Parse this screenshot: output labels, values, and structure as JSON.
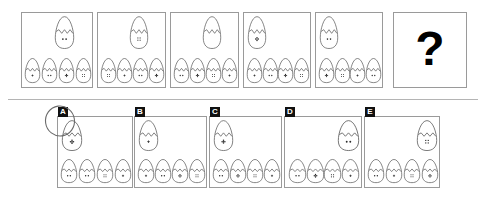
{
  "puzzle": {
    "title": "Egg Sequence Reasoning Puzzle",
    "unknown_marker": "?",
    "selected_option": "A",
    "question_panel_count": 6,
    "option_panel_count": 5
  },
  "colors": {
    "panel_border": "#9a9a9a",
    "egg_outline": "#555555",
    "divider": "#b4b4b4",
    "badge_bg": "#111111",
    "badge_text": "#ffffff",
    "qmark": "#000000",
    "background": "#ffffff",
    "selection_ink": "#6b6b6b"
  },
  "question_row": {
    "panels": [
      {
        "name": "question-panel-1",
        "top_egg": {
          "align": "center",
          "face": "two-dots"
        },
        "bottom_eggs": [
          {
            "face": "small-cross"
          },
          {
            "face": "two-dots"
          },
          {
            "face": "flower"
          },
          {
            "face": "four-squares"
          }
        ]
      },
      {
        "name": "question-panel-2",
        "top_egg": {
          "align": "center",
          "face": "four-squares"
        },
        "bottom_eggs": [
          {
            "face": "four-squares"
          },
          {
            "face": "small-cross"
          },
          {
            "face": "two-dots"
          },
          {
            "face": "flower"
          }
        ]
      },
      {
        "name": "question-panel-3",
        "top_egg": {
          "align": "center",
          "face": "blank"
        },
        "bottom_eggs": [
          {
            "face": "two-dots"
          },
          {
            "face": "flower"
          },
          {
            "face": "four-squares"
          },
          {
            "face": "small-cross"
          }
        ]
      },
      {
        "name": "question-panel-4",
        "top_egg": {
          "align": "left",
          "face": "flower"
        },
        "bottom_eggs": [
          {
            "face": "small-cross"
          },
          {
            "face": "two-dots"
          },
          {
            "face": "flower"
          },
          {
            "face": "four-squares"
          }
        ]
      },
      {
        "name": "question-panel-5",
        "top_egg": {
          "align": "left",
          "face": "two-dots"
        },
        "bottom_eggs": [
          {
            "face": "flower"
          },
          {
            "face": "four-squares"
          },
          {
            "face": "small-cross"
          },
          {
            "face": "two-dots"
          }
        ]
      },
      {
        "name": "question-panel-6",
        "is_unknown": true,
        "label": "?"
      }
    ]
  },
  "option_row": {
    "panels": [
      {
        "name": "option-panel-a",
        "label": "A",
        "selected": true,
        "top_egg": {
          "align": "left",
          "face": "flower"
        },
        "bottom_eggs": [
          {
            "face": "two-dots"
          },
          {
            "face": "two-dots"
          },
          {
            "face": "four-squares"
          },
          {
            "face": "small-cross"
          }
        ]
      },
      {
        "name": "option-panel-b",
        "label": "B",
        "selected": false,
        "top_egg": {
          "align": "left",
          "face": "small-cross"
        },
        "bottom_eggs": [
          {
            "face": "small-cross"
          },
          {
            "face": "two-dots"
          },
          {
            "face": "flower"
          },
          {
            "face": "four-squares"
          }
        ]
      },
      {
        "name": "option-panel-c",
        "label": "C",
        "selected": false,
        "top_egg": {
          "align": "left",
          "face": "flower"
        },
        "bottom_eggs": [
          {
            "face": "two-dots"
          },
          {
            "face": "flower"
          },
          {
            "face": "four-squares"
          },
          {
            "face": "small-cross"
          }
        ]
      },
      {
        "name": "option-panel-d",
        "label": "D",
        "selected": false,
        "top_egg": {
          "align": "right",
          "face": "two-dots"
        },
        "bottom_eggs": [
          {
            "face": "two-dots"
          },
          {
            "face": "flower"
          },
          {
            "face": "four-squares"
          },
          {
            "face": "small-cross"
          }
        ]
      },
      {
        "name": "option-panel-e",
        "label": "E",
        "selected": false,
        "top_egg": {
          "align": "right",
          "face": "four-squares"
        },
        "bottom_eggs": [
          {
            "face": "two-dots"
          },
          {
            "face": "small-cross"
          },
          {
            "face": "four-squares"
          },
          {
            "face": "flower"
          }
        ]
      }
    ]
  },
  "layout": {
    "question_panels_geom": [
      {
        "x": 21,
        "y": 12,
        "w": 72,
        "h": 76
      },
      {
        "x": 97,
        "y": 12,
        "w": 69,
        "h": 76
      },
      {
        "x": 170,
        "y": 12,
        "w": 69,
        "h": 76
      },
      {
        "x": 243,
        "y": 12,
        "w": 68,
        "h": 76
      },
      {
        "x": 315,
        "y": 12,
        "w": 68,
        "h": 76
      },
      {
        "x": 393,
        "y": 12,
        "w": 74,
        "h": 76
      }
    ],
    "option_panels_geom": [
      {
        "x": 57,
        "y": 116,
        "w": 76,
        "h": 72
      },
      {
        "x": 134,
        "y": 116,
        "w": 73,
        "h": 72
      },
      {
        "x": 209,
        "y": 116,
        "w": 73,
        "h": 72
      },
      {
        "x": 284,
        "y": 116,
        "w": 78,
        "h": 72
      },
      {
        "x": 364,
        "y": 116,
        "w": 76,
        "h": 72
      }
    ],
    "divider": {
      "x": 8,
      "y": 99,
      "w": 470
    }
  }
}
